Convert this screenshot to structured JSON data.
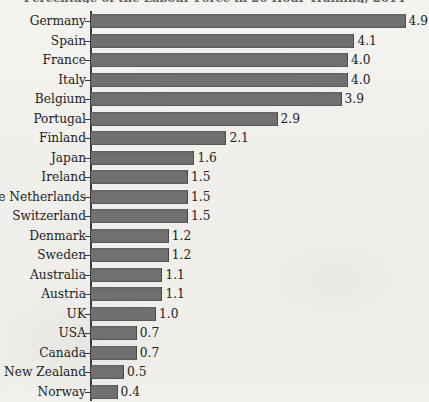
{
  "chart_data": {
    "type": "bar",
    "orientation": "horizontal",
    "title": "Percentage of the Labour Force in 20 Hour Training, 2014",
    "title_visibility": "clipped at top edge of image, largely illegible",
    "xlabel": "",
    "ylabel": "",
    "xlim": [
      0,
      5.3
    ],
    "grid": false,
    "legend": null,
    "value_label_format": "one decimal place",
    "bar_color": "#6f6f6f",
    "axis_color": "#3b3b3b",
    "background_color": "#f1f0ec",
    "categories": [
      "Germany",
      "Spain",
      "France",
      "Italy",
      "Belgium",
      "Portugal",
      "Finland",
      "Japan",
      "Ireland",
      "The Netherlands",
      "Switzerland",
      "Denmark",
      "Sweden",
      "Australia",
      "Austria",
      "UK",
      "USA",
      "Canada",
      "New Zealand",
      "Norway"
    ],
    "values": [
      4.9,
      4.1,
      4.0,
      4.0,
      3.9,
      2.9,
      2.1,
      1.6,
      1.5,
      1.5,
      1.5,
      1.2,
      1.2,
      1.1,
      1.1,
      1.0,
      0.7,
      0.7,
      0.5,
      0.4
    ],
    "value_labels": [
      "4.9",
      "4.1",
      "4.0",
      "4.0",
      "3.9",
      "2.9",
      "2.1",
      "1.6",
      "1.5",
      "1.5",
      "1.5",
      "1.2",
      "1.2",
      "1.1",
      "1.1",
      "1.0",
      "0.7",
      "0.7",
      "0.5",
      "0.4"
    ]
  }
}
